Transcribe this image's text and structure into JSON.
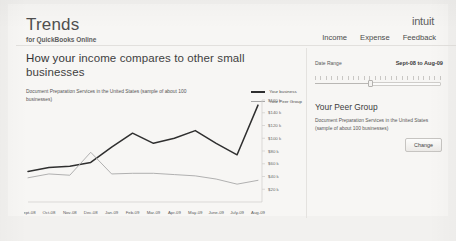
{
  "header": {
    "brand_title": "Trends",
    "brand_subtitle": "for QuickBooks Online",
    "logo": "intuit",
    "nav": [
      {
        "label": "Income"
      },
      {
        "label": "Expense"
      },
      {
        "label": "Feedback"
      }
    ]
  },
  "main": {
    "headline_lead": "How your ",
    "headline_rest": "income compares to other small businesses",
    "subtitle": "Document Preparation Services in the United States (sample of about 100 businesses)",
    "legend": [
      {
        "label": "Your business",
        "color": "#2f2f2f"
      },
      {
        "label": "Your Peer Group",
        "color": "#a8a8a8"
      }
    ]
  },
  "panel": {
    "date_range_label": "Date Range",
    "date_range_value": "Sept-08 to Aug-09",
    "peer_group_title": "Your Peer Group",
    "peer_group_desc": "Document Preparation Services in the United States (sample of about 100 businesses)",
    "change_label": "Change"
  },
  "chart_data": {
    "type": "line",
    "title": "How your income compares to other small businesses",
    "subtitle": "Document Preparation Services in the United States (sample of about 100 businesses)",
    "xlabel": "",
    "ylabel": "",
    "categories": [
      "Sept-08",
      "Oct-08",
      "Nov-08",
      "Dec-08",
      "Jan-09",
      "Feb-09",
      "Mar-09",
      "Apr-09",
      "May-09",
      "June-09",
      "July-09",
      "Aug-09"
    ],
    "ylim": [
      0,
      160000
    ],
    "yticks": [
      20000,
      40000,
      60000,
      80000,
      100000,
      120000,
      140000,
      160000
    ],
    "ytick_labels": [
      "$20 k",
      "$40 k",
      "$60 k",
      "$80 k",
      "$100 k",
      "$120 k",
      "$140 k",
      "$160 k"
    ],
    "grid": false,
    "legend_position": "top-right",
    "series": [
      {
        "name": "Your business",
        "color": "#2f2f2f",
        "values": [
          48000,
          54000,
          56000,
          62000,
          86000,
          108000,
          92000,
          100000,
          112000,
          92000,
          74000,
          152000
        ]
      },
      {
        "name": "Your Peer Group",
        "color": "#a8a8a8",
        "values": [
          38000,
          44000,
          42000,
          78000,
          44000,
          45000,
          45000,
          43000,
          41000,
          36000,
          28000,
          34000
        ]
      }
    ]
  }
}
